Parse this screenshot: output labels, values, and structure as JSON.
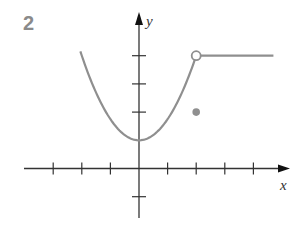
{
  "figure": {
    "label": "2"
  },
  "chart_data": {
    "type": "line",
    "title": "",
    "xlabel": "x",
    "ylabel": "y",
    "xlim": [
      -4,
      5.2
    ],
    "ylim": [
      -1.7,
      5.5
    ],
    "grid": false,
    "legend": null,
    "x_ticks": [
      -3,
      -2,
      -1,
      1,
      2,
      3,
      4
    ],
    "y_ticks": [
      -1,
      2,
      3,
      4
    ],
    "series": [
      {
        "name": "parabola",
        "equation": "y = 1 + 0.75 x^2",
        "domain": [
          -2.05,
          2
        ],
        "color": "#8f8f8f"
      },
      {
        "name": "horizontal",
        "equation": "y = 4",
        "domain": [
          2,
          4.7
        ],
        "color": "#8f8f8f"
      }
    ],
    "points": [
      {
        "x": 2,
        "y": 4,
        "style": "open",
        "note": "open circle (excluded endpoint)"
      },
      {
        "x": 2,
        "y": 2,
        "style": "filled",
        "note": "f(2) = 2"
      }
    ],
    "colors": {
      "axis": "#333333",
      "curve": "#8f8f8f",
      "label": "#8a8a8a"
    }
  },
  "axes": {
    "x_label": "x",
    "y_label": "y"
  }
}
